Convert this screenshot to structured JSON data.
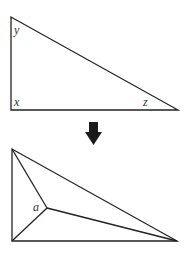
{
  "diagram": {
    "top_triangle": {
      "vertices": {
        "top_left": [
          11,
          17
        ],
        "bottom_left": [
          11,
          110
        ],
        "right": [
          178,
          110
        ]
      },
      "labels": {
        "y": "y",
        "x": "x",
        "z": "z"
      }
    },
    "arrow": {
      "direction": "down",
      "color": "#1a1a1a"
    },
    "bottom_triangle": {
      "vertices": {
        "top_left": [
          12,
          149
        ],
        "bottom_left": [
          12,
          241
        ],
        "right": [
          177,
          241
        ]
      },
      "interior_point": [
        47,
        208
      ],
      "labels": {
        "a": "a"
      }
    },
    "stroke_color": "#222222"
  }
}
